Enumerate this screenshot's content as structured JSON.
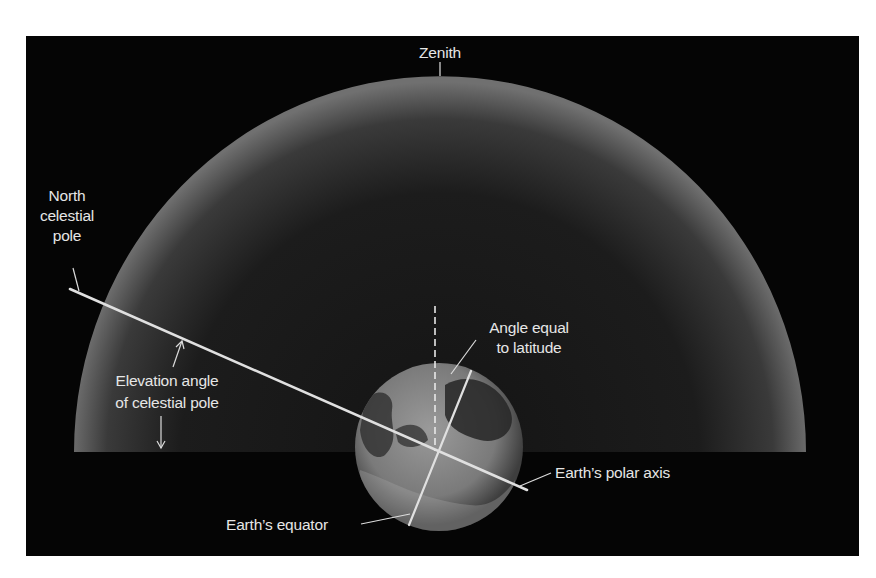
{
  "diagram": {
    "colors": {
      "background": "#050505",
      "dome_rim": "#6e6e6e",
      "dome_center": "#161616",
      "line": "#e0e0e0",
      "label": "#e6e6e6",
      "earth": "#8a8a8a"
    },
    "labels": {
      "zenith": "Zenith",
      "north_celestial_pole": "North\ncelestial\npole",
      "elevation_angle": "Elevation angle\nof celestial pole",
      "angle_latitude": "Angle equal\nto latitude",
      "polar_axis": "Earth’s polar axis",
      "equator": "Earth’s equator"
    },
    "elements": [
      "celestial-dome",
      "earth-globe",
      "polar-axis-line",
      "equator-line",
      "zenith-dashed-line"
    ]
  }
}
